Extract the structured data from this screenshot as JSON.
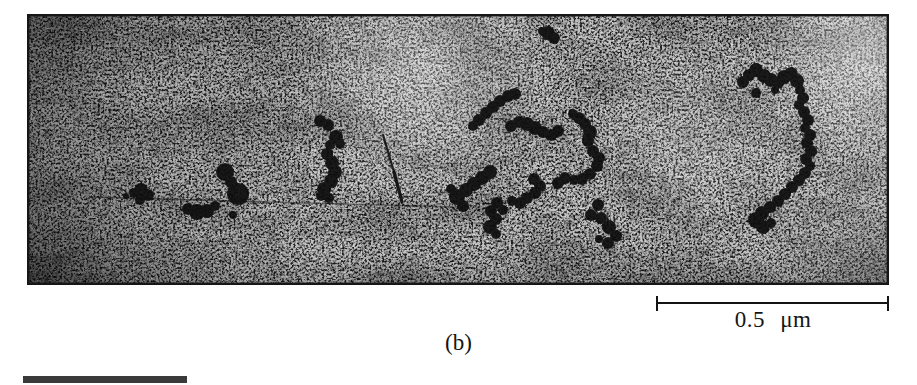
{
  "figure": {
    "type": "TEM micrograph panel",
    "panel_label": "(b)",
    "scale_bar": {
      "label": "0.5 μm"
    }
  },
  "micrograph": {
    "background": "#c2c2c2",
    "particle_color": "#0d0d0d",
    "border_color": "#161616",
    "clusters": [
      {
        "name": "isolated-particle-top",
        "dots": [
          [
            521,
            19,
            7
          ],
          [
            527,
            24,
            6
          ],
          [
            515,
            17,
            4
          ]
        ]
      },
      {
        "name": "small-cluster-left",
        "dots": [
          [
            99,
            182,
            3
          ],
          [
            107,
            179,
            5
          ],
          [
            114,
            176,
            7
          ],
          [
            121,
            181,
            6
          ],
          [
            113,
            186,
            5
          ]
        ]
      },
      {
        "name": "cluster-left",
        "dots": [
          [
            198,
            158,
            9
          ],
          [
            204,
            168,
            6
          ],
          [
            211,
            180,
            11
          ],
          [
            206,
            201,
            4
          ],
          [
            161,
            195,
            6
          ],
          [
            170,
            198,
            8
          ],
          [
            180,
            197,
            7
          ],
          [
            188,
            192,
            5
          ]
        ]
      },
      {
        "name": "zigzag-chain-center-left",
        "dots": [
          [
            293,
            107,
            6
          ],
          [
            301,
            111,
            6
          ],
          [
            309,
            123,
            7
          ],
          [
            313,
            130,
            5
          ],
          [
            303,
            131,
            5
          ],
          [
            300,
            140,
            6
          ],
          [
            305,
            149,
            7
          ],
          [
            308,
            158,
            7
          ],
          [
            304,
            167,
            7
          ],
          [
            297,
            175,
            7
          ],
          [
            294,
            182,
            5
          ],
          [
            302,
            184,
            5
          ]
        ]
      },
      {
        "name": "loop-cluster-center",
        "dots": [
          [
            446,
            112,
            5
          ],
          [
            452,
            106,
            6
          ],
          [
            459,
            99,
            6
          ],
          [
            466,
            93,
            6
          ],
          [
            473,
            87,
            6
          ],
          [
            481,
            82,
            6
          ],
          [
            488,
            80,
            6
          ],
          [
            484,
            112,
            6
          ],
          [
            492,
            108,
            6
          ],
          [
            500,
            110,
            7
          ],
          [
            508,
            114,
            7
          ],
          [
            516,
            118,
            6
          ],
          [
            524,
            121,
            6
          ],
          [
            531,
            117,
            6
          ],
          [
            546,
            100,
            5
          ],
          [
            552,
            104,
            6
          ],
          [
            558,
            110,
            6
          ],
          [
            563,
            118,
            7
          ],
          [
            561,
            127,
            6
          ],
          [
            566,
            137,
            6
          ],
          [
            572,
            144,
            6
          ],
          [
            570,
            152,
            6
          ],
          [
            563,
            160,
            6
          ],
          [
            555,
            165,
            6
          ],
          [
            547,
            166,
            5
          ],
          [
            538,
            164,
            6
          ],
          [
            531,
            169,
            6
          ],
          [
            507,
            165,
            6
          ],
          [
            513,
            172,
            6
          ],
          [
            508,
            179,
            6
          ],
          [
            500,
            184,
            6
          ],
          [
            493,
            189,
            6
          ],
          [
            485,
            187,
            5
          ],
          [
            476,
            196,
            5
          ],
          [
            470,
            189,
            6
          ],
          [
            464,
            197,
            6
          ],
          [
            469,
            205,
            6
          ],
          [
            463,
            213,
            7
          ],
          [
            469,
            220,
            5
          ],
          [
            463,
            158,
            7
          ],
          [
            455,
            164,
            7
          ],
          [
            447,
            170,
            7
          ],
          [
            439,
            176,
            7
          ],
          [
            430,
            183,
            8
          ],
          [
            436,
            192,
            6
          ],
          [
            424,
            175,
            5
          ]
        ]
      },
      {
        "name": "branch-cluster-below-loop",
        "dots": [
          [
            571,
            191,
            6
          ],
          [
            564,
            201,
            6
          ],
          [
            574,
            204,
            6
          ],
          [
            582,
            213,
            7
          ],
          [
            589,
            222,
            6
          ],
          [
            581,
            229,
            6
          ],
          [
            572,
            225,
            4
          ]
        ]
      },
      {
        "name": "s-chain-right",
        "dots": [
          [
            716,
            68,
            6
          ],
          [
            722,
            61,
            6
          ],
          [
            729,
            56,
            7
          ],
          [
            737,
            62,
            7
          ],
          [
            744,
            66,
            7
          ],
          [
            751,
            69,
            6
          ],
          [
            757,
            63,
            7
          ],
          [
            764,
            60,
            7
          ],
          [
            770,
            67,
            7
          ],
          [
            729,
            79,
            5
          ],
          [
            748,
            76,
            4
          ],
          [
            773,
            76,
            5
          ],
          [
            776,
            84,
            6
          ],
          [
            772,
            91,
            5
          ],
          [
            777,
            98,
            6
          ],
          [
            781,
            106,
            6
          ],
          [
            778,
            114,
            5
          ],
          [
            783,
            121,
            6
          ],
          [
            780,
            129,
            6
          ],
          [
            784,
            137,
            6
          ],
          [
            779,
            145,
            6
          ],
          [
            783,
            152,
            5
          ],
          [
            778,
            159,
            6
          ],
          [
            772,
            166,
            6
          ],
          [
            765,
            173,
            6
          ],
          [
            758,
            180,
            6
          ],
          [
            751,
            187,
            6
          ],
          [
            743,
            193,
            6
          ],
          [
            735,
            199,
            7
          ],
          [
            729,
            206,
            8
          ],
          [
            736,
            213,
            7
          ],
          [
            744,
            209,
            5
          ]
        ]
      }
    ],
    "lines": [
      {
        "name": "dislocation-line-left",
        "x1": 63,
        "y1": 183,
        "x2": 240,
        "y2": 188,
        "w": 1.5,
        "o": 0.55
      },
      {
        "name": "dislocation-line-mid",
        "x1": 240,
        "y1": 188,
        "x2": 430,
        "y2": 193,
        "w": 1.3,
        "o": 0.4
      },
      {
        "name": "dislocation-line-right",
        "x1": 593,
        "y1": 198,
        "x2": 727,
        "y2": 208,
        "w": 1.2,
        "o": 0.22
      },
      {
        "name": "needle-defect-upper",
        "x1": 356,
        "y1": 121,
        "x2": 367,
        "y2": 158,
        "w": 2.2,
        "o": 0.88
      },
      {
        "name": "needle-defect-lower",
        "x1": 367,
        "y1": 158,
        "x2": 375,
        "y2": 188,
        "w": 3.2,
        "o": 0.92
      }
    ]
  },
  "footer_bar": {
    "color": "#3a3a3a"
  }
}
